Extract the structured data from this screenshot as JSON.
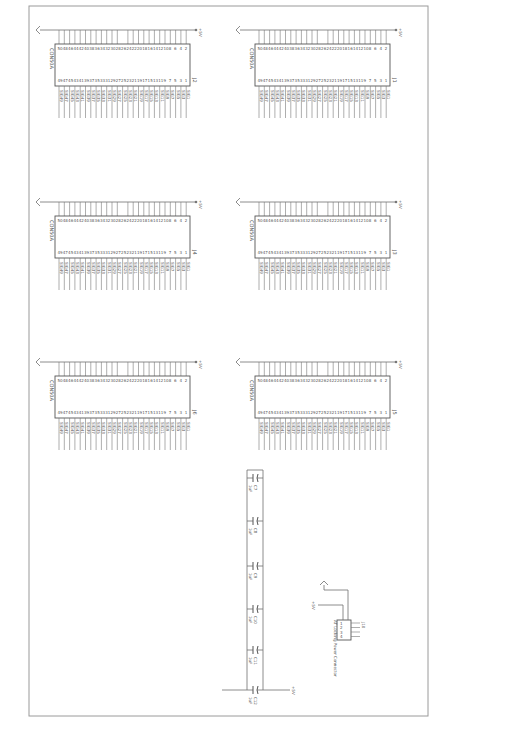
{
  "sheet": {
    "orientation": "rotated-90",
    "border_color": "#9a9a9a"
  },
  "connectors": [
    {
      "ref": "J1",
      "part": "CON50A",
      "power": "+5V",
      "col": "right",
      "row": 0
    },
    {
      "ref": "J2",
      "part": "CON50A",
      "power": "+5V",
      "col": "left",
      "row": 0
    },
    {
      "ref": "J3",
      "part": "CON50A",
      "power": "+5V",
      "col": "right",
      "row": 1
    },
    {
      "ref": "J4",
      "part": "CON50A",
      "power": "+5V",
      "col": "left",
      "row": 1
    },
    {
      "ref": "J5",
      "part": "CON50A",
      "power": "+5V",
      "col": "right",
      "row": 2
    },
    {
      "ref": "J6",
      "part": "CON50A",
      "power": "+5V",
      "col": "left",
      "row": 2
    }
  ],
  "capacitors": [
    {
      "ref": "C7",
      "value": "1uF"
    },
    {
      "ref": "C8",
      "value": "1uF"
    },
    {
      "ref": "C9",
      "value": "1uF"
    },
    {
      "ref": "C10",
      "value": "1uF"
    },
    {
      "ref": "C11",
      "value": "1uF"
    },
    {
      "ref": "C12",
      "value": "1uF"
    }
  ],
  "power_connector": {
    "ref": "J10",
    "label": "AT Locking Power Connector",
    "power": "+5V",
    "pins": [
      "1",
      "2",
      "3",
      "4"
    ]
  },
  "rail_label": "+5V"
}
